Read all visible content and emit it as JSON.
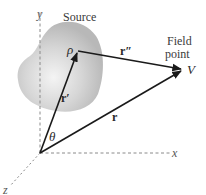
{
  "diagram": {
    "source_label": "Source",
    "field_point_label_line1": "Field",
    "field_point_label_line2": "point",
    "field_point_symbol": "V",
    "source_point_symbol": "ρ",
    "angle_symbol": "θ",
    "vectors": {
      "r_prime": "r′",
      "r_double_prime": "r″",
      "r": "r"
    },
    "axes": {
      "x": "x",
      "y": "y",
      "z": "z"
    },
    "colors": {
      "blob_fill": "#c8c8c8",
      "blob_highlight": "#f2f2f2",
      "vector_stroke": "#1a1a1a",
      "axis_stroke": "#8a8a8a"
    }
  }
}
